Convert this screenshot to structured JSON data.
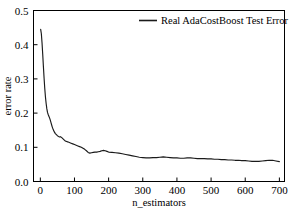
{
  "chart_data": {
    "type": "line",
    "title": "",
    "xlabel": "n_estimators",
    "ylabel": "error rate",
    "xlim": [
      -20,
      715
    ],
    "ylim": [
      0.0,
      0.5
    ],
    "grid": false,
    "legend_position": "top-right",
    "xticks": [
      0,
      100,
      200,
      300,
      400,
      500,
      600,
      700
    ],
    "xticklabels": [
      "0",
      "100",
      "200",
      "300",
      "400",
      "500",
      "600",
      "700"
    ],
    "yticks": [
      0.0,
      0.1,
      0.2,
      0.3,
      0.4,
      0.5
    ],
    "yticklabels": [
      "0.0",
      "0.1",
      "0.2",
      "0.3",
      "0.4",
      "0.5"
    ],
    "series": [
      {
        "name": "Real AdaCostBoost Test Error",
        "color": "#1a1a1a",
        "x": [
          1,
          3,
          5,
          7,
          9,
          11,
          13,
          15,
          17,
          19,
          21,
          23,
          25,
          27,
          29,
          31,
          33,
          35,
          38,
          41,
          44,
          47,
          50,
          53,
          56,
          59,
          62,
          65,
          68,
          71,
          74,
          77,
          80,
          85,
          90,
          95,
          100,
          105,
          110,
          115,
          120,
          125,
          130,
          135,
          140,
          145,
          150,
          155,
          160,
          165,
          170,
          175,
          180,
          185,
          190,
          195,
          200,
          210,
          220,
          230,
          240,
          250,
          260,
          270,
          280,
          290,
          300,
          310,
          320,
          330,
          340,
          350,
          360,
          370,
          380,
          390,
          400,
          410,
          420,
          430,
          440,
          450,
          460,
          470,
          480,
          490,
          500,
          510,
          520,
          530,
          540,
          550,
          560,
          570,
          580,
          590,
          600,
          610,
          620,
          630,
          640,
          650,
          660,
          670,
          680,
          690,
          700
        ],
        "y": [
          0.445,
          0.432,
          0.405,
          0.372,
          0.336,
          0.302,
          0.272,
          0.247,
          0.228,
          0.213,
          0.202,
          0.196,
          0.191,
          0.186,
          0.18,
          0.173,
          0.166,
          0.159,
          0.151,
          0.145,
          0.14,
          0.137,
          0.134,
          0.132,
          0.13,
          0.131,
          0.129,
          0.126,
          0.123,
          0.12,
          0.118,
          0.117,
          0.116,
          0.114,
          0.112,
          0.11,
          0.108,
          0.106,
          0.104,
          0.102,
          0.1,
          0.097,
          0.094,
          0.09,
          0.085,
          0.083,
          0.084,
          0.085,
          0.086,
          0.086,
          0.087,
          0.088,
          0.09,
          0.091,
          0.09,
          0.088,
          0.086,
          0.085,
          0.084,
          0.083,
          0.081,
          0.079,
          0.077,
          0.075,
          0.073,
          0.071,
          0.07,
          0.069,
          0.069,
          0.07,
          0.07,
          0.071,
          0.072,
          0.071,
          0.07,
          0.069,
          0.069,
          0.068,
          0.068,
          0.069,
          0.069,
          0.068,
          0.067,
          0.067,
          0.067,
          0.066,
          0.066,
          0.065,
          0.065,
          0.064,
          0.064,
          0.063,
          0.063,
          0.062,
          0.062,
          0.061,
          0.061,
          0.06,
          0.059,
          0.059,
          0.059,
          0.06,
          0.061,
          0.062,
          0.062,
          0.06,
          0.058
        ]
      }
    ]
  },
  "legend": {
    "entries": [
      {
        "label": "Real AdaCostBoost Test Error"
      }
    ]
  },
  "axes": {
    "x_title": "n_estimators",
    "y_title": "error rate"
  }
}
